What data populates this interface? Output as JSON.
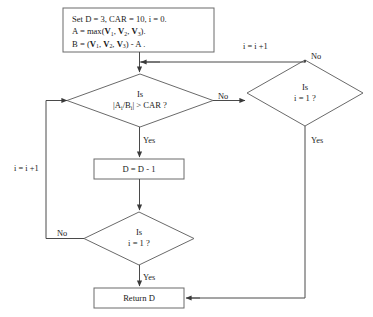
{
  "diagram": {
    "background_color": "#ffffff",
    "line_color": "#4a4a4a",
    "text_color": "#1a1a1a",
    "nodes": {
      "init": {
        "type": "process",
        "line1": "Set  D = 3, CAR = 10,   i = 0.",
        "line2_prefix": "A = max(",
        "line2_v1": "V",
        "line2_v1_sub": "1",
        "line2_sep1": ", ",
        "line2_v2": "V",
        "line2_v2_sub": "2",
        "line2_sep2": ", ",
        "line2_v3": "V",
        "line2_v3_sub": "3",
        "line2_suffix": ")."
      },
      "init_line3": {
        "prefix": "B = (",
        "v1": "V",
        "v1_sub": "1",
        "sep1": ", ",
        "v2": "V",
        "v2_sub": "2",
        "sep2": ", ",
        "v3": "V",
        "v3_sub": "3",
        "suffix": ") - A ."
      },
      "decision_ratio": {
        "type": "decision",
        "line1": "Is",
        "line2_a": "|A",
        "line2_a_sub": "i",
        "line2_slash": "/B",
        "line2_b_sub": "i",
        "line2_rest": "| > CAR ?"
      },
      "decision_i_right": {
        "type": "decision",
        "line1": "Is",
        "line2": "i = 1 ?"
      },
      "process_decrement": {
        "type": "process",
        "label": "D = D - 1"
      },
      "decision_i_bottom": {
        "type": "decision",
        "line1": "Is",
        "line2": "i = 1 ?"
      },
      "terminal_return": {
        "type": "terminal",
        "label": "Return D"
      }
    },
    "edge_labels": {
      "ratio_no": "No",
      "ratio_yes": "Yes",
      "right_no": "No",
      "right_increment": "i = i +1",
      "right_yes": "Yes",
      "bottom_no": "No",
      "bottom_yes": "Yes",
      "left_increment": "i = i +1"
    }
  }
}
